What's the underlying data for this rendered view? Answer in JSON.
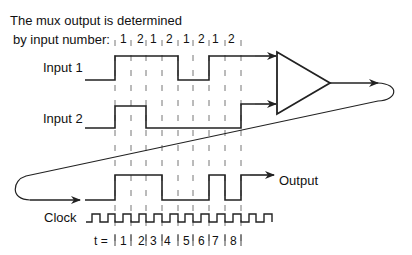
{
  "title": {
    "line1": "The mux output is determined",
    "line2": "by input number:"
  },
  "selectors": [
    "1",
    "2",
    "1",
    "2",
    "1",
    "2",
    "1",
    "2"
  ],
  "signals": {
    "input1": "Input 1",
    "input2": "Input 2",
    "output": "Output",
    "clock": "Clock"
  },
  "time": {
    "prefix": "t =",
    "slots": [
      "1",
      "2",
      "3",
      "4",
      "5",
      "6",
      "7",
      "8"
    ]
  },
  "waveforms": {
    "input1": [
      1,
      1,
      1,
      1,
      0,
      0,
      1,
      1
    ],
    "input2": [
      1,
      1,
      0,
      0,
      0,
      0,
      0,
      0
    ],
    "output": [
      1,
      1,
      1,
      0,
      0,
      0,
      1,
      0
    ]
  },
  "colors": {
    "stroke": "#222222",
    "grid": "#777777"
  }
}
